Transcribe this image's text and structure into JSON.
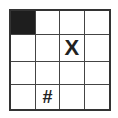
{
  "grid": {
    "rows": 4,
    "cols": 4,
    "filled_cells": [
      [
        0,
        0
      ]
    ],
    "cells": [
      [
        "",
        "",
        "",
        ""
      ],
      [
        "",
        "",
        "X",
        ""
      ],
      [
        "",
        "",
        "",
        ""
      ],
      [
        "",
        "#",
        "",
        ""
      ]
    ],
    "colors": {
      "filled": "#1e1e1e",
      "line": "#333333",
      "background": "#ffffff"
    }
  }
}
